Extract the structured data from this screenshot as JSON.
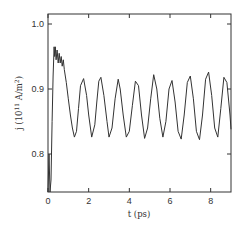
{
  "chart_data": {
    "type": "line",
    "title": "",
    "xlabel": "t (ps)",
    "ylabel": "j (10^11 A/m^2)",
    "ylabel_parts": {
      "main": "j (10",
      "exp": "11",
      "unit": " A/m",
      "unit_exp": "2",
      "close": ")"
    },
    "xlim": [
      0,
      9
    ],
    "ylim": [
      0.74,
      1.015
    ],
    "xticks": [
      0,
      2,
      4,
      6,
      8
    ],
    "xtick_labels": [
      "0",
      "2",
      "4",
      "6",
      "8"
    ],
    "yticks": [
      0.8,
      0.9,
      1.0
    ],
    "ytick_labels": [
      "0.8",
      "0.9",
      "1.0"
    ],
    "grid": false,
    "legend": null,
    "series": [
      {
        "name": "current density",
        "color": "#333333",
        "x": [
          0.0,
          0.05,
          0.1,
          0.15,
          0.2,
          0.25,
          0.3,
          0.33,
          0.36,
          0.4,
          0.45,
          0.5,
          0.55,
          0.6,
          0.65,
          0.7,
          0.75,
          0.8,
          0.9,
          1.0,
          1.1,
          1.2,
          1.3,
          1.4,
          1.5,
          1.6,
          1.75,
          1.9,
          2.0,
          2.15,
          2.3,
          2.4,
          2.5,
          2.6,
          2.75,
          2.9,
          3.0,
          3.15,
          3.3,
          3.45,
          3.55,
          3.7,
          3.85,
          4.0,
          4.15,
          4.3,
          4.45,
          4.6,
          4.75,
          4.9,
          5.05,
          5.2,
          5.35,
          5.5,
          5.65,
          5.8,
          5.95,
          6.1,
          6.25,
          6.4,
          6.55,
          6.7,
          6.85,
          7.0,
          7.15,
          7.3,
          7.45,
          7.6,
          7.75,
          7.9,
          8.05,
          8.2,
          8.35,
          8.5,
          8.65,
          8.8,
          8.95,
          9.0
        ],
        "y": [
          0.74,
          0.8,
          0.74,
          0.76,
          0.85,
          0.92,
          0.965,
          0.95,
          0.965,
          0.945,
          0.96,
          0.94,
          0.955,
          0.94,
          0.95,
          0.935,
          0.945,
          0.93,
          0.91,
          0.885,
          0.86,
          0.84,
          0.826,
          0.835,
          0.87,
          0.905,
          0.916,
          0.89,
          0.86,
          0.826,
          0.845,
          0.88,
          0.912,
          0.918,
          0.89,
          0.85,
          0.826,
          0.84,
          0.885,
          0.915,
          0.9,
          0.86,
          0.826,
          0.835,
          0.875,
          0.912,
          0.905,
          0.86,
          0.824,
          0.84,
          0.885,
          0.922,
          0.9,
          0.855,
          0.826,
          0.85,
          0.9,
          0.913,
          0.88,
          0.835,
          0.823,
          0.86,
          0.91,
          0.92,
          0.885,
          0.835,
          0.822,
          0.86,
          0.915,
          0.926,
          0.89,
          0.84,
          0.826,
          0.87,
          0.918,
          0.91,
          0.86,
          0.838
        ]
      }
    ]
  }
}
